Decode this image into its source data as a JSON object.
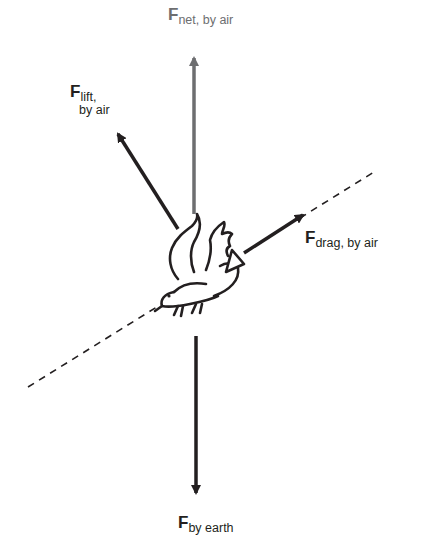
{
  "diagram": {
    "colors": {
      "ink": "#231f20",
      "net_force": "#6d6e70",
      "background": "#ffffff"
    },
    "forces": {
      "net": {
        "symbol": "F",
        "subscript": "net, by air",
        "color": "#6d6e70",
        "direction": "up"
      },
      "lift": {
        "symbol": "F",
        "subscript_line1": "lift,",
        "subscript_line2": "by air",
        "direction": "up-left"
      },
      "drag": {
        "symbol": "F",
        "subscript": "drag, by air",
        "direction": "up-right (along flight path)"
      },
      "gravity": {
        "symbol": "F",
        "subscript": "by earth",
        "direction": "down"
      }
    },
    "flight_path": {
      "style": "dashed",
      "direction": "diagonal, lower-left to upper-right"
    },
    "object": "bird-illustration"
  }
}
